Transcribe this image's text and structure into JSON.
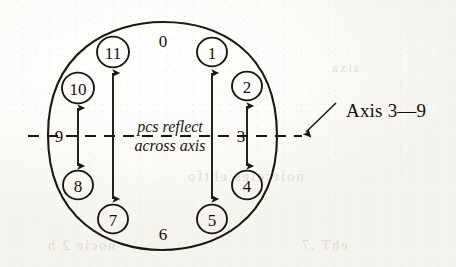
{
  "figure": {
    "kind": "pitch-class clock face with reflection axis",
    "center_note": {
      "line1": "pcs reflect",
      "line2": "across axis"
    },
    "axis_caption": "Axis 3—9",
    "clock": {
      "circled_nodes": [
        {
          "label": "1",
          "cx": 212,
          "cy": 52,
          "r": 15
        },
        {
          "label": "2",
          "cx": 247,
          "cy": 86,
          "r": 15
        },
        {
          "label": "4",
          "cx": 247,
          "cy": 185,
          "r": 15
        },
        {
          "label": "5",
          "cx": 212,
          "cy": 219,
          "r": 15
        },
        {
          "label": "7",
          "cx": 113,
          "cy": 219,
          "r": 15
        },
        {
          "label": "8",
          "cx": 78,
          "cy": 185,
          "r": 15
        },
        {
          "label": "10",
          "cx": 78,
          "cy": 88,
          "r": 16
        },
        {
          "label": "11",
          "cx": 113,
          "cy": 52,
          "r": 16
        }
      ],
      "bare_labels": [
        {
          "label": "0",
          "x": 163,
          "y": 41
        },
        {
          "label": "6",
          "x": 163,
          "y": 234
        },
        {
          "label": "3",
          "x": 241,
          "y": 136
        },
        {
          "label": "9",
          "x": 59,
          "y": 136
        }
      ]
    },
    "reflection_arrows": [
      {
        "name": "arrow-11-to-7",
        "x": 113,
        "y_top": 72,
        "y_bottom": 200
      },
      {
        "name": "arrow-1-to-5",
        "x": 212,
        "y_top": 72,
        "y_bottom": 200
      },
      {
        "name": "arrow-10-to-8",
        "x": 78,
        "y_top": 107,
        "y_bottom": 166
      },
      {
        "name": "arrow-2-to-4",
        "x": 247,
        "y_top": 105,
        "y_bottom": 166
      }
    ],
    "axis_line": {
      "y": 136,
      "x_start": 28,
      "x_end": 302
    },
    "leader": {
      "x1": 334,
      "y1": 104,
      "x2": 305,
      "y2": 133
    },
    "colors": {
      "ink": "#1b180f",
      "paper": "#fbfaf7",
      "ghost": "#b9b2a4"
    }
  },
  "ghost_text": [
    {
      "text": "noitceles  ehtfo",
      "x": 186,
      "y": 168,
      "size": 15
    },
    {
      "text": "nocie  2  h",
      "x": 46,
      "y": 238,
      "size": 14
    },
    {
      "text": "ehT  .7",
      "x": 300,
      "y": 238,
      "size": 14
    },
    {
      "text": "sixa",
      "x": 330,
      "y": 60,
      "size": 13
    }
  ]
}
